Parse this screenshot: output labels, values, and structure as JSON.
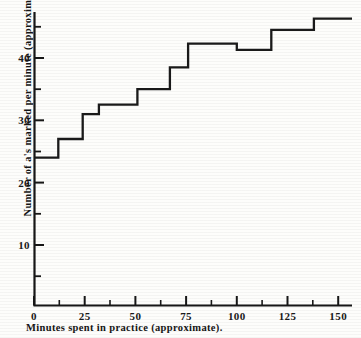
{
  "chart_data": {
    "type": "line",
    "subtype": "step",
    "title": "",
    "xlabel": "Minutes spent in practice (approximate).",
    "ylabel": "Number of a's marked per minute (approximate).",
    "xlim": [
      0,
      160
    ],
    "ylim": [
      0,
      48
    ],
    "xticks": [
      0,
      25,
      50,
      75,
      100,
      125,
      150
    ],
    "xtick_labels": [
      "0",
      "25",
      "50",
      "75",
      "100",
      "125",
      "150"
    ],
    "xminor_ticks": [
      12,
      37,
      62,
      87,
      112,
      137
    ],
    "yticks": [
      10,
      20,
      30,
      40
    ],
    "ytick_labels": [
      "10",
      "20",
      "30",
      "40"
    ],
    "yminor_ticks": [
      5,
      15,
      25,
      35,
      45
    ],
    "grid": false,
    "legend": false,
    "line_color": "#1a1a1a",
    "background_color": "#fdfdfb",
    "steps": [
      {
        "x_start": 0,
        "x_end": 12,
        "value": 24.0
      },
      {
        "x_start": 12,
        "x_end": 24,
        "value": 27.0
      },
      {
        "x_start": 24,
        "x_end": 32,
        "value": 31.0
      },
      {
        "x_start": 32,
        "x_end": 51,
        "value": 32.5
      },
      {
        "x_start": 51,
        "x_end": 67,
        "value": 35.0
      },
      {
        "x_start": 67,
        "x_end": 76,
        "value": 38.5
      },
      {
        "x_start": 76,
        "x_end": 100,
        "value": 42.3
      },
      {
        "x_start": 100,
        "x_end": 117,
        "value": 41.3
      },
      {
        "x_start": 117,
        "x_end": 138,
        "value": 44.5
      },
      {
        "x_start": 138,
        "x_end": 155,
        "value": 46.3
      }
    ],
    "x": [
      0,
      12,
      24,
      32,
      51,
      67,
      76,
      100,
      117,
      138,
      155
    ],
    "values": [
      24.0,
      27.0,
      31.0,
      32.5,
      35.0,
      38.5,
      42.3,
      41.3,
      44.5,
      46.3,
      46.3
    ]
  }
}
